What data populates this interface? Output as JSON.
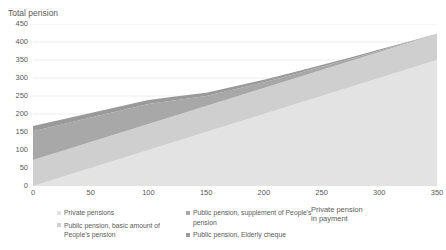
{
  "chart_data": {
    "type": "area",
    "stacked": true,
    "title": "",
    "ylabel": "Total pension",
    "xlabel": "Private pension\nin payment",
    "xlim": [
      0,
      350
    ],
    "ylim": [
      0,
      450
    ],
    "ytick_labels": [
      "0",
      "50",
      "100",
      "150",
      "200",
      "250",
      "300",
      "350",
      "400",
      "450"
    ],
    "ytick_values": [
      0,
      50,
      100,
      150,
      200,
      250,
      300,
      350,
      400,
      450
    ],
    "xtick_labels": [
      "0",
      "50",
      "100",
      "150",
      "200",
      "250",
      "300",
      "350"
    ],
    "xtick_values": [
      0,
      50,
      100,
      150,
      200,
      250,
      300,
      350
    ],
    "grid": true,
    "grid_axis": "y",
    "legend_position": "bottom",
    "x": [
      0,
      25,
      50,
      75,
      100,
      125,
      150,
      175,
      200,
      225,
      250,
      275,
      300,
      325,
      350
    ],
    "series": [
      {
        "name": "Private pensions",
        "color": "#e3e3e3",
        "values": [
          0,
          25,
          50,
          75,
          100,
          125,
          150,
          175,
          200,
          225,
          250,
          275,
          300,
          325,
          350
        ]
      },
      {
        "name": "Public pension, basic amount of People's pension",
        "color": "#cfcfcf",
        "values": [
          72,
          72,
          72,
          72,
          72,
          72,
          72,
          72,
          72,
          72,
          72,
          72,
          72,
          72,
          72
        ]
      },
      {
        "name": "Public pension, supplement of People's pension",
        "color": "#a8a8a8",
        "values": [
          80,
          74,
          68,
          62,
          56,
          42,
          28,
          22,
          16,
          12,
          9,
          6,
          4,
          2,
          0
        ]
      },
      {
        "name": "Public pension, Elderly cheque",
        "color": "#9a9a9a",
        "values": [
          15,
          14,
          13,
          12,
          11,
          10,
          9,
          8,
          7,
          6,
          5,
          4,
          3,
          2,
          1
        ]
      }
    ],
    "totals": [
      167,
      185,
      203,
      221,
      239,
      249,
      259,
      277,
      295,
      315,
      336,
      357,
      379,
      401,
      423
    ]
  },
  "legend": {
    "columns": [
      {
        "items": [
          {
            "label": "Private pensions",
            "color": "#e3e3e3",
            "marker": "legend-swatch-private-pensions"
          },
          {
            "label": "Public pension, basic amount of People's pension",
            "color": "#cfcfcf",
            "marker": "legend-swatch-basic-amount"
          }
        ]
      },
      {
        "items": [
          {
            "label": "Public pension, supplement of People's pension",
            "color": "#a8a8a8",
            "marker": "legend-swatch-supplement"
          },
          {
            "label": "Public pension, Elderly cheque",
            "color": "#9a9a9a",
            "marker": "legend-swatch-elderly-cheque"
          }
        ]
      }
    ]
  },
  "axes": {
    "y_title": "Total pension",
    "x_title": "Private pension\nin payment"
  },
  "colors": {
    "grid": "#e8e8e8",
    "axis_line": "#d9d9d9",
    "text": "#5a5a5a",
    "plot_background": "#ffffff"
  }
}
